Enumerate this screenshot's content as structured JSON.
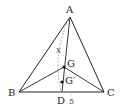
{
  "diagram": {
    "type": "geometry",
    "points": {
      "A": {
        "label": "A",
        "x": 70,
        "y": 17
      },
      "B": {
        "label": "B",
        "x": 19,
        "y": 92
      },
      "C": {
        "label": "C",
        "x": 104,
        "y": 92
      },
      "D": {
        "label": "D",
        "x": 62,
        "y": 92
      },
      "G": {
        "label": "G",
        "x": 64,
        "y": 67
      },
      "Gp": {
        "label": "G′",
        "x": 62,
        "y": 82
      }
    },
    "annotations": {
      "x_label": "x",
      "five_label": "5"
    },
    "colors": {
      "line": "#222222",
      "dashed": "#999999"
    }
  }
}
